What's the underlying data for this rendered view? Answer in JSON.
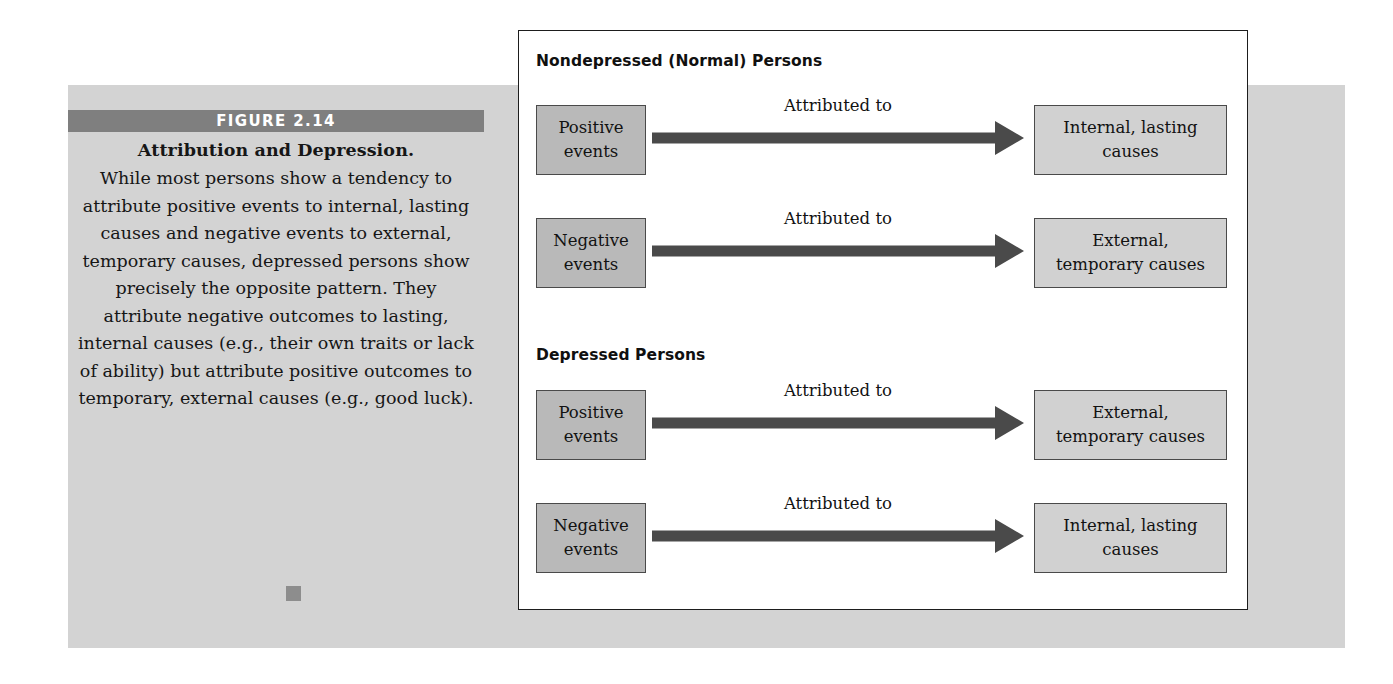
{
  "figure": {
    "label": "FIGURE 2.14",
    "title": "Attribution and Depression.",
    "caption": "While most persons show a tendency to attribute positive events to internal, lasting causes and negative events to external, temporary causes, depressed persons show precisely the opposite pattern. They attribute negative out­comes to lasting, internal causes (e.g., their own traits or lack of ability) but attribute positive outcomes to temporary, exter­nal causes (e.g., good luck)."
  },
  "colors": {
    "panel_background": "#d3d3d3",
    "band_background": "#7f7f7f",
    "band_text": "#ffffff",
    "source_box_fill": "#b9b9b9",
    "target_box_fill": "#d1d1d1",
    "box_border": "#4a4a4a",
    "arrow_fill": "#4a4a4a",
    "diagram_border": "#1d1d1d",
    "caption_dot": "#8d8d8d"
  },
  "diagram": {
    "sections": [
      {
        "header": "Nondepressed (Normal) Persons"
      },
      {
        "header": "Depressed Persons"
      }
    ],
    "rows": [
      {
        "section": 0,
        "source_line1": "Positive",
        "source_line2": "events",
        "arrow_label": "Attributed to",
        "target_line1": "Internal, lasting",
        "target_line2": "causes"
      },
      {
        "section": 0,
        "source_line1": "Negative",
        "source_line2": "events",
        "arrow_label": "Attributed to",
        "target_line1": "External,",
        "target_line2": "temporary causes"
      },
      {
        "section": 1,
        "source_line1": "Positive",
        "source_line2": "events",
        "arrow_label": "Attributed to",
        "target_line1": "External,",
        "target_line2": "temporary causes"
      },
      {
        "section": 1,
        "source_line1": "Negative",
        "source_line2": "events",
        "arrow_label": "Attributed to",
        "target_line1": "Internal, lasting",
        "target_line2": "causes"
      }
    ]
  }
}
